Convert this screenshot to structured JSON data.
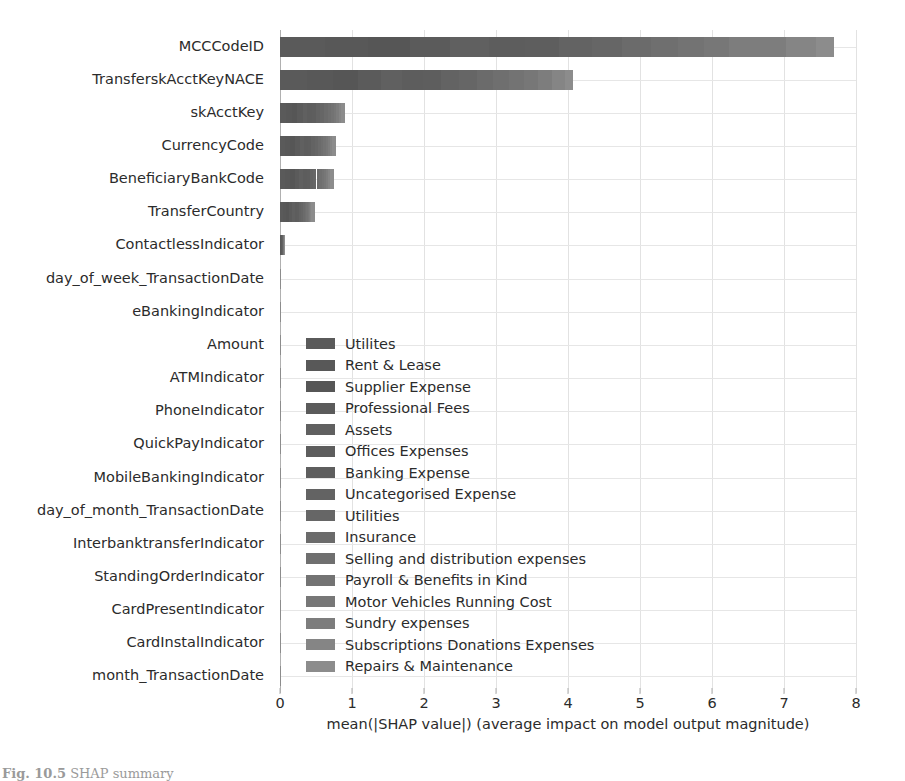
{
  "chart_data": {
    "type": "bar",
    "orientation": "horizontal",
    "stacked": true,
    "title": "",
    "xlabel": "mean(|SHAP value|) (average impact on model output magnitude)",
    "ylabel": "",
    "xlim": [
      0,
      8
    ],
    "xticks": [
      0,
      1,
      2,
      3,
      4,
      5,
      6,
      7,
      8
    ],
    "xticklabels": [
      "0",
      "1",
      "2",
      "3",
      "4",
      "5",
      "6",
      "7",
      "8"
    ],
    "grid": true,
    "legend_position": "center",
    "categories": [
      "MCCCodeID",
      "TransferskAcctKeyNACE",
      "skAcctKey",
      "CurrencyCode",
      "BeneficiaryBankCode",
      "TransferCountry",
      "ContactlessIndicator",
      "day_of_week_TransactionDate",
      "eBankingIndicator",
      "Amount",
      "ATMIndicator",
      "PhoneIndicator",
      "QuickPayIndicator",
      "MobileBankingIndicator",
      "day_of_month_TransactionDate",
      "InterbanktransferIndicator",
      "StandingOrderIndicator",
      "CardPresentIndicator",
      "CardInstalIndicator",
      "month_TransactionDate"
    ],
    "totals": [
      7.7,
      4.67,
      0.95,
      0.82,
      0.8,
      0.5,
      0.06,
      0.005,
      0.004,
      0.004,
      0.003,
      0.003,
      0.003,
      0.002,
      0.002,
      0.002,
      0.001,
      0.001,
      0.001,
      0.001
    ],
    "series": [
      {
        "name": "Utilites",
        "color": "#5a5a5a",
        "values": [
          0.62,
          0.38,
          0.085,
          0.075,
          0.072,
          0.046,
          0.006,
          0.0005,
          0.0004,
          0.0004,
          0.0003,
          0.0003,
          0.0003,
          0.0002,
          0.0002,
          0.0002,
          0.0001,
          0.0001,
          0.0001,
          0.0001
        ]
      },
      {
        "name": "Rent & Lease",
        "color": "#585858",
        "values": [
          0.6,
          0.36,
          0.08,
          0.07,
          0.068,
          0.043,
          0.005,
          0.0004,
          0.0004,
          0.0004,
          0.0003,
          0.0003,
          0.0002,
          0.0002,
          0.0002,
          0.0002,
          0.0001,
          0.0001,
          0.0001,
          0.0001
        ]
      },
      {
        "name": "Supplier Expense",
        "color": "#565656",
        "values": [
          0.58,
          0.34,
          0.076,
          0.066,
          0.064,
          0.04,
          0.005,
          0.0004,
          0.0003,
          0.0003,
          0.0003,
          0.0002,
          0.0002,
          0.0002,
          0.0002,
          0.0001,
          0.0001,
          0.0001,
          0.0001,
          0.0001
        ]
      },
      {
        "name": "Professional Fees",
        "color": "#5b5b5b",
        "values": [
          0.56,
          0.32,
          0.072,
          0.062,
          0.06,
          0.038,
          0.005,
          0.0004,
          0.0003,
          0.0003,
          0.0002,
          0.0002,
          0.0002,
          0.0002,
          0.0001,
          0.0001,
          0.0001,
          0.0001,
          0.0001,
          0.0001
        ]
      },
      {
        "name": "Assets",
        "color": "#606060",
        "values": [
          0.54,
          0.3,
          0.068,
          0.058,
          0.056,
          0.035,
          0.004,
          0.0004,
          0.0003,
          0.0003,
          0.0002,
          0.0002,
          0.0002,
          0.0001,
          0.0001,
          0.0001,
          0.0001,
          0.0001,
          0.0001,
          0.0001
        ]
      },
      {
        "name": "Offices Expenses",
        "color": "#5d5d5d",
        "values": [
          0.5,
          0.28,
          0.064,
          0.054,
          0.052,
          0.033,
          0.004,
          0.0003,
          0.0003,
          0.0003,
          0.0002,
          0.0002,
          0.0002,
          0.0001,
          0.0001,
          0.0001,
          0.0001,
          0.0001,
          0.0001,
          0.0001
        ]
      },
      {
        "name": "Banking Expense",
        "color": "#5e5e5e",
        "values": [
          0.48,
          0.26,
          0.06,
          0.05,
          0.048,
          0.03,
          0.004,
          0.0003,
          0.0003,
          0.0002,
          0.0002,
          0.0002,
          0.0001,
          0.0001,
          0.0001,
          0.0001,
          0.0001,
          0.0001,
          0.0001,
          0.0001
        ]
      },
      {
        "name": "Uncategorised Expense",
        "color": "#636363",
        "values": [
          0.45,
          0.25,
          0.056,
          0.046,
          0.045,
          0.028,
          0.003,
          0.0003,
          0.0002,
          0.0002,
          0.0002,
          0.0002,
          0.0001,
          0.0001,
          0.0001,
          0.0001,
          0.0001,
          0.0001,
          0.0001,
          0.0001
        ]
      },
      {
        "name": "Utilities",
        "color": "#666666",
        "values": [
          0.42,
          0.24,
          0.052,
          0.043,
          0.042,
          0.026,
          0.003,
          0.0003,
          0.0002,
          0.0002,
          0.0002,
          0.0001,
          0.0001,
          0.0001,
          0.0001,
          0.0001,
          0.0001,
          0.0001,
          0.0001,
          0.0001
        ]
      },
      {
        "name": "Insurance",
        "color": "#6b6b6b",
        "values": [
          0.4,
          0.23,
          0.048,
          0.04,
          0.039,
          0.024,
          0.003,
          0.0002,
          0.0002,
          0.0002,
          0.0001,
          0.0001,
          0.0001,
          0.0001,
          0.0001,
          0.0001,
          0.0001,
          0.0001,
          0.0001,
          0.0001
        ]
      },
      {
        "name": "Selling and distribution expenses",
        "color": "#6f6f6f",
        "values": [
          0.38,
          0.22,
          0.044,
          0.037,
          0.036,
          0.022,
          0.003,
          0.0002,
          0.0002,
          0.0002,
          0.0001,
          0.0001,
          0.0001,
          0.0001,
          0.0001,
          0.0001,
          0.0001,
          0.0001,
          0.0001,
          0.0001
        ]
      },
      {
        "name": "Payroll & Benefits in Kind",
        "color": "#737373",
        "values": [
          0.36,
          0.21,
          0.04,
          0.034,
          0.033,
          0.02,
          0.002,
          0.0002,
          0.0002,
          0.0001,
          0.0001,
          0.0001,
          0.0001,
          0.0001,
          0.0001,
          0.0001,
          0.0001,
          0.0001,
          0.0001,
          0.0001
        ]
      },
      {
        "name": "Motor Vehicles Running Cost",
        "color": "#777777",
        "values": [
          0.34,
          0.2,
          0.036,
          0.031,
          0.03,
          0.019,
          0.002,
          0.0002,
          0.0001,
          0.0001,
          0.0001,
          0.0001,
          0.0001,
          0.0001,
          0.0001,
          0.0001,
          0.0001,
          0.0001,
          0.0001,
          0.0001
        ]
      },
      {
        "name": "Sundry expenses",
        "color": "#7d7d7d",
        "values": [
          0.8,
          0.19,
          0.033,
          0.028,
          0.027,
          0.017,
          0.002,
          0.0002,
          0.0001,
          0.0001,
          0.0001,
          0.0001,
          0.0001,
          0.0001,
          0.0001,
          0.0001,
          0.0001,
          0.0001,
          0.0001,
          0.0001
        ]
      },
      {
        "name": "Subscriptions Donations Expenses",
        "color": "#858585",
        "values": [
          0.41,
          0.18,
          0.03,
          0.025,
          0.024,
          0.015,
          0.002,
          0.0001,
          0.0001,
          0.0001,
          0.0001,
          0.0001,
          0.0001,
          0.0001,
          0.0001,
          0.0001,
          0.0001,
          0.0001,
          0.0001,
          0.0001
        ]
      },
      {
        "name": "Repairs & Maintenance",
        "color": "#8c8c8c",
        "values": [
          0.26,
          0.11,
          0.056,
          0.052,
          0.048,
          0.044,
          0.003,
          0.0001,
          0.0001,
          0.0001,
          0.0001,
          0.0001,
          0.0001,
          0.0001,
          0.0001,
          0.0001,
          0.0001,
          0.0001,
          0.0001,
          0.0001
        ]
      }
    ]
  },
  "caption": {
    "label": "Fig. 10.5",
    "text": "SHAP summary"
  },
  "style": {
    "bar_dark": "#5a5a5a",
    "bar_light": "#8c8c8c",
    "grid_color": "#e2e2e2",
    "axis_color": "#b0b0b0",
    "text_color": "#2b2b2b",
    "background": "#ffffff"
  }
}
